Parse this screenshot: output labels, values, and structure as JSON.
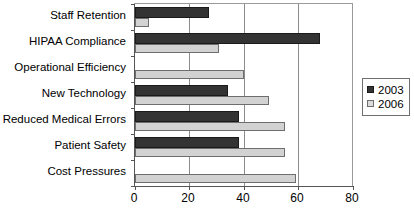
{
  "chart_data": {
    "type": "bar",
    "orientation": "horizontal",
    "title": "",
    "xlabel": "",
    "ylabel": "",
    "xlim": [
      0,
      80
    ],
    "xticks": [
      0,
      20,
      40,
      60,
      80
    ],
    "grid": true,
    "legend_position": "right",
    "categories": [
      "Staff Retention",
      "HIPAA Compliance",
      "Operational Efficiency",
      "New Technology",
      "Reduced Medical Errors",
      "Patient Safety",
      "Cost Pressures"
    ],
    "series": [
      {
        "name": "2003",
        "color": "#333333",
        "values": [
          27,
          68,
          null,
          34,
          38,
          38,
          null
        ]
      },
      {
        "name": "2006",
        "color": "#d2d2d2",
        "values": [
          5,
          31,
          40,
          49,
          55,
          55,
          59
        ]
      }
    ]
  },
  "legend": {
    "entries": [
      {
        "label": "2003",
        "swatch": "dark-square-swatch"
      },
      {
        "label": "2006",
        "swatch": "light-square-swatch"
      }
    ]
  },
  "axis": {
    "x_tick_labels": [
      "0",
      "20",
      "40",
      "60",
      "80"
    ]
  }
}
